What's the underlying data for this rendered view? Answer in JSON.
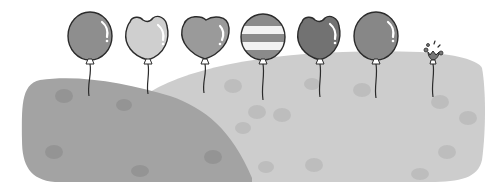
{
  "scene": {
    "description": "Illustration of balloons floating above grassy hills",
    "background": "#ffffff",
    "outline_color": "#2b2b2b",
    "hills": [
      {
        "name": "left-hill",
        "color": "#a3a3a3",
        "spot_color": "#949494"
      },
      {
        "name": "right-hill",
        "color": "#cdcdcd",
        "spot_color": "#bdbdbd"
      }
    ],
    "balloons": [
      {
        "name": "round-balloon",
        "shape": "round",
        "color": "#8e8e8e",
        "cx": 90,
        "cy": 34
      },
      {
        "name": "cat-ear-balloon",
        "shape": "tulip",
        "color": "#cfcfcf",
        "cx": 148,
        "cy": 36
      },
      {
        "name": "heart-balloon",
        "shape": "heart",
        "color": "#9a9a9a",
        "cx": 205,
        "cy": 36
      },
      {
        "name": "striped-balloon",
        "shape": "striped",
        "color": "#8a8a8a",
        "stripe_color": "#f2f2f2",
        "cx": 263,
        "cy": 36
      },
      {
        "name": "tulip-balloon",
        "shape": "tulip",
        "color": "#727272",
        "cx": 320,
        "cy": 36
      },
      {
        "name": "round-balloon-2",
        "shape": "round",
        "color": "#878787",
        "cx": 376,
        "cy": 34
      },
      {
        "name": "popped-balloon",
        "shape": "popped",
        "color": "#777777",
        "cx": 433,
        "cy": 52
      }
    ]
  }
}
